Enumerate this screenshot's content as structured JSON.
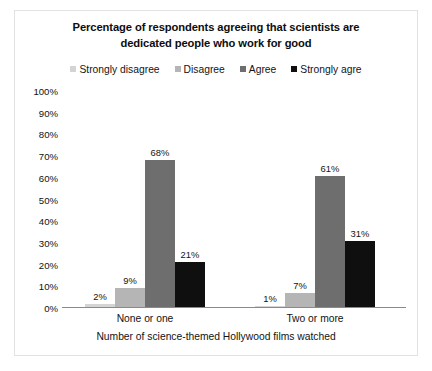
{
  "chart_data": {
    "type": "bar",
    "title": "Percentage of respondents agreeing that scientists are dedicated people who work for good",
    "title_line1": "Percentage of respondents agreeing that scientists are",
    "title_line2": "dedicated people who work for good",
    "xlabel": "Number of science-themed Hollywood films watched",
    "ylabel": "",
    "ylim": [
      0,
      100
    ],
    "ytick_labels": [
      "100%",
      "90%",
      "80%",
      "70%",
      "60%",
      "50%",
      "40%",
      "30%",
      "20%",
      "10%",
      "0%"
    ],
    "ytick_values": [
      100,
      90,
      80,
      70,
      60,
      50,
      40,
      30,
      20,
      10,
      0
    ],
    "grid": false,
    "legend_position": "top-center",
    "categories": [
      "None or one",
      "Two or more"
    ],
    "series": [
      {
        "name": "Strongly disagree",
        "color": "#d4d4d4",
        "values": [
          2,
          1
        ],
        "labels": [
          "2%",
          "1%"
        ]
      },
      {
        "name": "Disagree",
        "color": "#b5b5b5",
        "values": [
          9,
          7
        ],
        "labels": [
          "9%",
          "7%"
        ]
      },
      {
        "name": "Agree",
        "color": "#6e6e6e",
        "values": [
          68,
          61
        ],
        "labels": [
          "68%",
          "61%"
        ]
      },
      {
        "name": "Strongly agre",
        "color": "#0f0f0f",
        "values": [
          21,
          31
        ],
        "labels": [
          "21%",
          "31%"
        ]
      }
    ]
  }
}
